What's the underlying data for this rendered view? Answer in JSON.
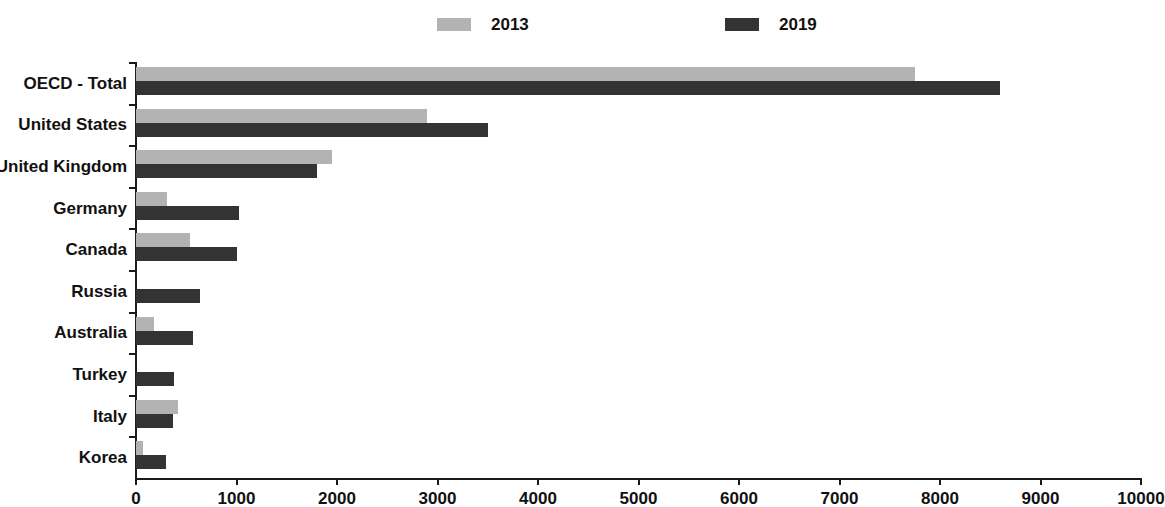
{
  "legend": {
    "position": "top",
    "entries": [
      {
        "label": "2013",
        "color": "#b3b3b3"
      },
      {
        "label": "2019",
        "color": "#333333"
      }
    ]
  },
  "axis": {
    "x_ticks": [
      "0",
      "1000",
      "2000",
      "3000",
      "4000",
      "5000",
      "6000",
      "7000",
      "8000",
      "9000",
      "10000"
    ],
    "xlabel": "",
    "ylabel": ""
  },
  "chart_data": {
    "type": "bar",
    "orientation": "horizontal",
    "title": "",
    "subtitle": "",
    "xlabel": "",
    "ylabel": "",
    "xlim": [
      0,
      10000
    ],
    "xticks": [
      0,
      1000,
      2000,
      3000,
      4000,
      5000,
      6000,
      7000,
      8000,
      9000,
      10000
    ],
    "grid": false,
    "legend_position": "top",
    "categories": [
      "OECD - Total",
      "United States",
      "United Kingdom",
      "Germany",
      "Canada",
      "Russia",
      "Australia",
      "Turkey",
      "Italy",
      "Korea"
    ],
    "series": [
      {
        "name": "2013",
        "color": "#b3b3b3",
        "values": [
          7750,
          2900,
          1950,
          310,
          540,
          0,
          180,
          0,
          420,
          70
        ]
      },
      {
        "name": "2019",
        "color": "#333333",
        "values": [
          8600,
          3500,
          1800,
          1020,
          1000,
          640,
          570,
          380,
          370,
          300
        ]
      }
    ]
  }
}
